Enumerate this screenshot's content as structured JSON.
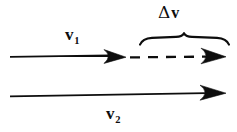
{
  "figure": {
    "background_color": "#ffffff",
    "ink_color": "#0d0d0d",
    "width": 237,
    "height": 132
  },
  "labels": {
    "v1": {
      "base": "v",
      "subscript": "1"
    },
    "v2": {
      "base": "v",
      "subscript": "2"
    },
    "delta_v": {
      "delta": "Δ",
      "base": "v"
    }
  },
  "diagram": {
    "arrows": [
      {
        "name": "v1-arrow",
        "label": "v1",
        "x_start": 10,
        "x_tip": 126,
        "y": 56,
        "style": "solid",
        "stroke_width": 2.2
      },
      {
        "name": "delta-v-arrow",
        "label": "delta_v",
        "x_start": 128,
        "x_tip": 226,
        "y": 57,
        "style": "dashed",
        "stroke_width": 2.2,
        "dash_pattern": "9 7"
      },
      {
        "name": "v2-arrow",
        "label": "v2",
        "x_start": 10,
        "x_tip": 226,
        "y": 95,
        "style": "solid",
        "stroke_width": 1.6
      }
    ],
    "brace": {
      "name": "delta-v-brace",
      "x_left": 140,
      "x_right": 229,
      "y": 43,
      "peak_x": 184,
      "peak_height": 7,
      "spans": "delta_v"
    }
  }
}
